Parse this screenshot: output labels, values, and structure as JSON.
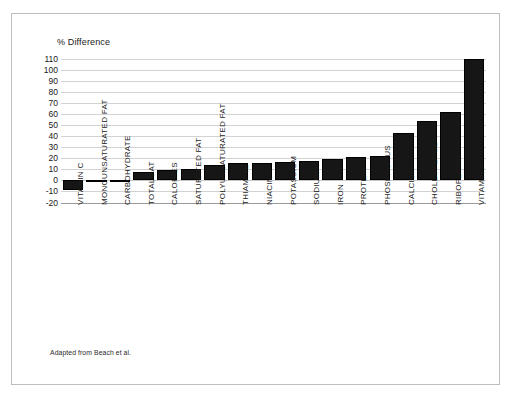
{
  "figure": {
    "source_note": "Adapted from Beach et al."
  },
  "chart_data": {
    "type": "bar",
    "title": "",
    "ylabel": "% Difference",
    "xlabel": "",
    "ylim": [
      -20,
      110
    ],
    "ytick_step": 10,
    "grid": true,
    "legend": "none",
    "bar_color": "#161616",
    "yticks": [
      110,
      100,
      90,
      80,
      70,
      60,
      50,
      40,
      30,
      20,
      10,
      0,
      -10,
      -20
    ],
    "categories": [
      "VITAMIN C",
      "MONOUNSATURATED FAT",
      "CARBOHYDRATE",
      "TOTAL FAT",
      "CALORIES",
      "SATURATED FAT",
      "POLYUNSATURATED FAT",
      "THIAMINE",
      "NIACIN",
      "POTASSIUM",
      "SODIUM",
      "IRON",
      "PROTEIN",
      "PHOSPHORUS",
      "CALCIUM",
      "CHOLESTEROL",
      "RIBOFLAVIN",
      "VITAMIN A"
    ],
    "values": [
      -9,
      -1,
      0,
      8,
      9,
      10,
      14,
      16,
      16,
      17,
      18,
      19,
      21,
      22,
      43,
      54,
      62,
      110
    ]
  }
}
